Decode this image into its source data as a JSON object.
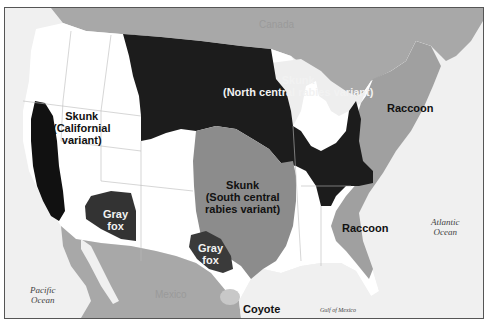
{
  "map": {
    "title": "Rabies reservoir variants in terrestrial mammals",
    "colors": {
      "ocean": "#f0f0f0",
      "land_unaffected": "#ffffff",
      "foreign_land": "#a8a8a8",
      "north_central_skunk": "#1c1c1c",
      "californian_skunk": "#111111",
      "south_central_skunk": "#8c8c8c",
      "raccoon": "#a0a0a0",
      "gray_fox": "#3a3a3a",
      "coyote": "#c8c8c8",
      "border": "#555555"
    },
    "regions": [
      {
        "id": "skunk-north-central",
        "label_line1": "Skunk",
        "label_line2": "(North central rabies variant)"
      },
      {
        "id": "skunk-californian",
        "label_line1": "Skunk",
        "label_line2": "(Californial",
        "label_line3": "variant)"
      },
      {
        "id": "skunk-south-central",
        "label_line1": "Skunk",
        "label_line2": "(South central",
        "label_line3": "rabies variant)"
      },
      {
        "id": "raccoon-northeast",
        "label": "Raccoon"
      },
      {
        "id": "raccoon-southeast",
        "label": "Raccoon"
      },
      {
        "id": "gray-fox-arizona",
        "label_line1": "Gray",
        "label_line2": "fox"
      },
      {
        "id": "gray-fox-texas",
        "label_line1": "Gray",
        "label_line2": "fox"
      },
      {
        "id": "coyote",
        "label": "Coyote"
      }
    ],
    "water_labels": {
      "pacific_line1": "Pacific",
      "pacific_line2": "Ocean",
      "atlantic_line1": "Atlantic",
      "atlantic_line2": "Ocean",
      "gulf": "Gulf of Mexico"
    },
    "countries": {
      "canada": "Canada",
      "mexico": "Mexico"
    }
  }
}
